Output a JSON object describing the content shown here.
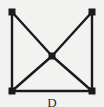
{
  "figure": {
    "label": "D",
    "background_color": "#f2f2f0",
    "ink_color": "#1a1a1a",
    "width": 104,
    "height": 107
  },
  "chart_data": {
    "type": "diagram",
    "diagram_kind": "undirected-graph",
    "title": "D",
    "xlabel": "",
    "ylabel": "",
    "grid": false,
    "legend": null,
    "xlim": [
      0,
      104
    ],
    "ylim": [
      0,
      107
    ],
    "node_shape": "square",
    "node_size_px": 7,
    "node_color": "#1a1a1a",
    "edge_color": "#1a1a1a",
    "edge_width_px": 2,
    "nodes": [
      {
        "id": "tl",
        "label": "",
        "x": 12,
        "y": 12
      },
      {
        "id": "tr",
        "label": "",
        "x": 92,
        "y": 12
      },
      {
        "id": "c",
        "label": "",
        "x": 52,
        "y": 56
      },
      {
        "id": "bl",
        "label": "",
        "x": 12,
        "y": 91
      },
      {
        "id": "br",
        "label": "",
        "x": 92,
        "y": 91
      }
    ],
    "edges": [
      {
        "from": "tl",
        "to": "bl",
        "kind": "left-side"
      },
      {
        "from": "tr",
        "to": "br",
        "kind": "right-side"
      },
      {
        "from": "bl",
        "to": "br",
        "kind": "bottom-side"
      },
      {
        "from": "tl",
        "to": "c",
        "kind": "diagonal"
      },
      {
        "from": "c",
        "to": "br",
        "kind": "diagonal"
      },
      {
        "from": "tr",
        "to": "c",
        "kind": "diagonal"
      },
      {
        "from": "c",
        "to": "bl",
        "kind": "diagonal"
      }
    ],
    "node_count": 5,
    "edge_count": 7,
    "annotations": [
      {
        "text": "D",
        "x": 52,
        "y": 101,
        "role": "figure-caption"
      }
    ]
  }
}
